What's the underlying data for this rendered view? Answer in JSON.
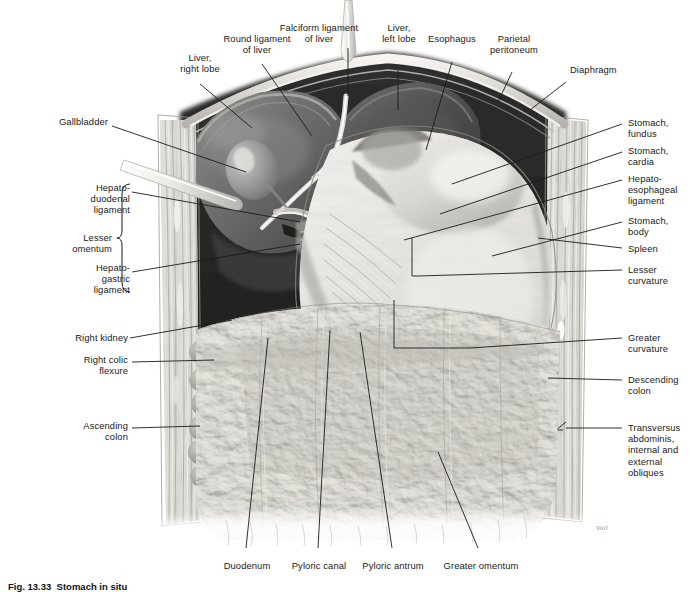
{
  "figure": {
    "caption_number": "Fig. 13.33",
    "caption_title": "Stomach in situ",
    "artist_signature": "Voll",
    "background_color": "#ffffff",
    "line_color": "#1b1b1b",
    "text_color": "#1a1a1a"
  },
  "labels_top_left": [
    {
      "id": "liver-right-lobe",
      "text": "Liver,\nright lobe"
    },
    {
      "id": "round-ligament-of-liver",
      "text": "Round ligament\nof liver"
    },
    {
      "id": "falciform-ligament-of-liver",
      "text": "Falciform ligament\nof liver"
    },
    {
      "id": "gallbladder",
      "text": "Gallbladder"
    }
  ],
  "labels_top_right": [
    {
      "id": "liver-left-lobe",
      "text": "Liver,\nleft lobe"
    },
    {
      "id": "esophagus",
      "text": "Esophagus"
    },
    {
      "id": "parietal-peritoneum",
      "text": "Parietal\nperitoneum"
    },
    {
      "id": "diaphragm",
      "text": "Diaphragm"
    }
  ],
  "labels_left": [
    {
      "id": "hepatoduodenal-ligament",
      "text": "Hepato-\nduodenal\nligament"
    },
    {
      "id": "lesser-omentum",
      "text": "Lesser\nomentum"
    },
    {
      "id": "hepatogastric-ligament",
      "text": "Hepato-\ngastric\nligament"
    },
    {
      "id": "right-kidney",
      "text": "Right kidney"
    },
    {
      "id": "right-colic-flexure",
      "text": "Right colic\nflexure"
    },
    {
      "id": "ascending-colon",
      "text": "Ascending\ncolon"
    }
  ],
  "labels_right": [
    {
      "id": "stomach-fundus",
      "text": "Stomach,\nfundus"
    },
    {
      "id": "stomach-cardia",
      "text": "Stomach,\ncardia"
    },
    {
      "id": "hepatoesophageal-ligament",
      "text": "Hepato-\nesophageal\nligament"
    },
    {
      "id": "stomach-body",
      "text": "Stomach,\nbody"
    },
    {
      "id": "spleen",
      "text": "Spleen"
    },
    {
      "id": "lesser-curvature",
      "text": "Lesser\ncurvature"
    },
    {
      "id": "greater-curvature",
      "text": "Greater\ncurvature"
    },
    {
      "id": "descending-colon",
      "text": "Descending\ncolon"
    },
    {
      "id": "transversus-abdominis",
      "text": "Transversus\nabdominis,\ninternal and\nexternal\nobliques"
    }
  ],
  "labels_bottom": [
    {
      "id": "duodenum",
      "text": "Duodenum"
    },
    {
      "id": "pyloric-canal",
      "text": "Pyloric canal"
    },
    {
      "id": "pyloric-antrum",
      "text": "Pyloric antrum"
    },
    {
      "id": "greater-omentum",
      "text": "Greater omentum"
    }
  ]
}
